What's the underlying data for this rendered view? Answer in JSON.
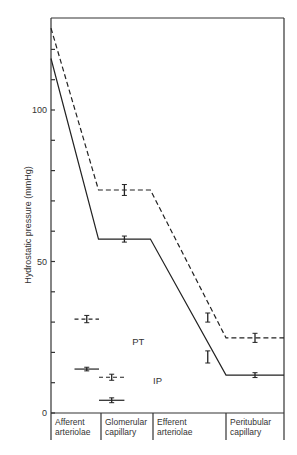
{
  "chart_data": {
    "type": "line",
    "title": "",
    "xlabel": "",
    "ylabel": "Hydrostatic pressure (mmHg)",
    "ylim": [
      0,
      130
    ],
    "yticks": [
      0,
      10,
      20,
      30,
      40,
      50,
      60,
      70,
      80,
      90,
      100,
      110,
      120
    ],
    "ytick_labels": [
      {
        "value": 0,
        "label": "0"
      },
      {
        "value": 50,
        "label": "50"
      },
      {
        "value": 100,
        "label": "100"
      }
    ],
    "grid": false,
    "categories": [
      "Afferent arteriolae",
      "Glomerular capillary",
      "Efferent arteriolae",
      "Peritubular capillary"
    ],
    "category_lines": [
      [
        "Afferent",
        "arteriolae"
      ],
      [
        "Glomerular",
        "capillary"
      ],
      [
        "Efferent",
        "arteriolae"
      ],
      [
        "Peritubular",
        "capillary"
      ]
    ],
    "series": [
      {
        "name": "dashed",
        "style": "dashed",
        "points": [
          [
            0,
            127
          ],
          [
            0.95,
            73.6
          ],
          [
            1.95,
            73.6
          ],
          [
            3.0,
            24.8
          ],
          [
            4.0,
            24.8
          ]
        ],
        "error_bars": [
          {
            "x": 1.45,
            "y": 73.6,
            "err": 1.8
          },
          {
            "x": 2.75,
            "y": 31.5,
            "err": 1.5
          },
          {
            "x": 3.5,
            "y": 24.8,
            "err": 1.5
          }
        ]
      },
      {
        "name": "solid",
        "style": "solid",
        "points": [
          [
            0,
            117
          ],
          [
            0.95,
            57.4
          ],
          [
            1.95,
            57.4
          ],
          [
            3.0,
            12.5
          ],
          [
            4.0,
            12.5
          ]
        ],
        "error_bars": [
          {
            "x": 1.45,
            "y": 57.4,
            "err": 1.0
          },
          {
            "x": 2.75,
            "y": 18.5,
            "err": 2.0
          },
          {
            "x": 3.5,
            "y": 12.5,
            "err": 0.8
          }
        ]
      }
    ],
    "annotations": [
      {
        "label": "PT",
        "x": 1.6,
        "y": 22.5
      },
      {
        "label": "IP",
        "x": 2.0,
        "y": 9.5
      }
    ],
    "separate_measurements": [
      {
        "group": "PT",
        "style": "dashed",
        "x_from": 0.47,
        "x_to": 0.96,
        "y": 31.0,
        "err": 1.2
      },
      {
        "group": "PT",
        "style": "solid",
        "x_from": 0.47,
        "x_to": 0.96,
        "y": 14.5,
        "err": 0.6
      },
      {
        "group": "IP",
        "style": "dashed",
        "x_from": 0.96,
        "x_to": 1.45,
        "y": 11.8,
        "err": 1.0
      },
      {
        "group": "IP",
        "style": "solid",
        "x_from": 0.96,
        "x_to": 1.45,
        "y": 4.2,
        "err": 0.8
      }
    ]
  }
}
